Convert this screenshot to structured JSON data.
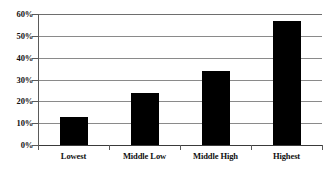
{
  "chart_data": {
    "type": "bar",
    "title": "",
    "subtitle": "",
    "xlabel": "",
    "ylabel": "",
    "categories": [
      "Lowest",
      "Middle Low",
      "Middle High",
      "Highest"
    ],
    "values": [
      13,
      24,
      34,
      57
    ],
    "value_suffix": "%",
    "ylim": [
      0,
      60
    ],
    "y_ticks": [
      0,
      10,
      20,
      30,
      40,
      50,
      60
    ],
    "y_tick_labels": [
      "0%",
      "10%",
      "20%",
      "30%",
      "40%",
      "50%",
      "60%"
    ],
    "grid": true,
    "grid_axis": "y",
    "legend": false,
    "legend_position": "none",
    "series": [
      {
        "name": "",
        "values": [
          13,
          24,
          34,
          57
        ]
      }
    ],
    "annotations": []
  },
  "style": {
    "bar_color": "#000000",
    "gridline_color": "#8a8a8a",
    "axis_color": "#5a5a5a",
    "text_color": "#111111",
    "background_color": "#ffffff"
  }
}
